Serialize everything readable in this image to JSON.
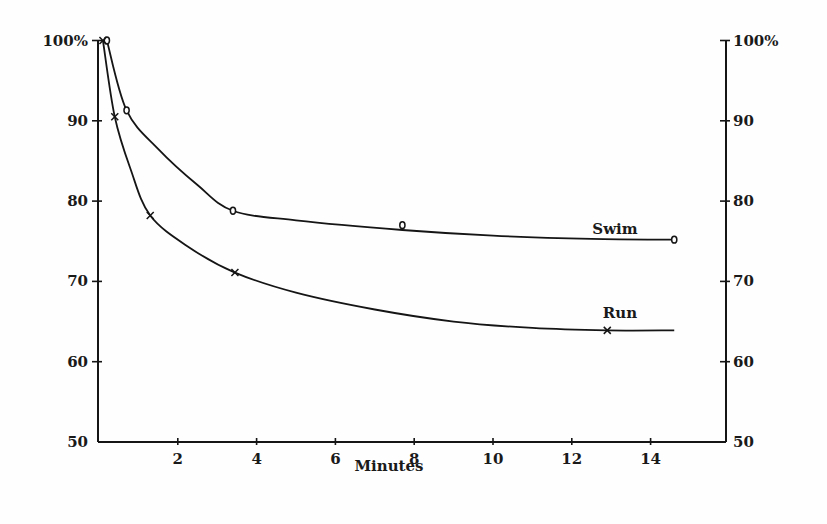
{
  "chart_data": {
    "type": "line",
    "title": "",
    "xlabel": "Minutes",
    "ylabel": "",
    "xlim": [
      0,
      15.5
    ],
    "ylim": [
      50,
      100
    ],
    "x_ticks": [
      2,
      4,
      6,
      8,
      10,
      12,
      14
    ],
    "x_tick_labels": [
      "2",
      "4",
      "6",
      "8",
      "10",
      "12",
      "14"
    ],
    "y_ticks": [
      50,
      60,
      70,
      80,
      90,
      100
    ],
    "y_tick_labels_left": [
      "50",
      "60",
      "70",
      "80",
      "90",
      "100%"
    ],
    "y_tick_labels_right": [
      "50",
      "60",
      "70",
      "80",
      "90",
      "100%"
    ],
    "grid": false,
    "legend": "inline labels at curve ends",
    "series": [
      {
        "name": "Swim",
        "marker": "o",
        "points": [
          {
            "x": 0.2,
            "y": 100
          },
          {
            "x": 0.7,
            "y": 91.3
          },
          {
            "x": 3.4,
            "y": 78.8
          },
          {
            "x": 7.7,
            "y": 77.0
          },
          {
            "x": 14.6,
            "y": 75.2
          }
        ],
        "curve": [
          {
            "x": 0.2,
            "y": 100
          },
          {
            "x": 0.7,
            "y": 91.3
          },
          {
            "x": 1.5,
            "y": 86.5
          },
          {
            "x": 2.5,
            "y": 82.0
          },
          {
            "x": 3.4,
            "y": 78.8
          },
          {
            "x": 5.0,
            "y": 77.6
          },
          {
            "x": 7.7,
            "y": 76.4
          },
          {
            "x": 10.0,
            "y": 75.7
          },
          {
            "x": 12.5,
            "y": 75.3
          },
          {
            "x": 14.6,
            "y": 75.2
          }
        ]
      },
      {
        "name": "Run",
        "marker": "x",
        "points": [
          {
            "x": 0.1,
            "y": 100
          },
          {
            "x": 0.4,
            "y": 90.5
          },
          {
            "x": 1.3,
            "y": 78.2
          },
          {
            "x": 3.45,
            "y": 71.1
          },
          {
            "x": 12.9,
            "y": 63.9
          }
        ],
        "curve": [
          {
            "x": 0.1,
            "y": 100
          },
          {
            "x": 0.4,
            "y": 90.5
          },
          {
            "x": 0.8,
            "y": 84.0
          },
          {
            "x": 1.3,
            "y": 78.2
          },
          {
            "x": 2.3,
            "y": 74.2
          },
          {
            "x": 3.45,
            "y": 71.1
          },
          {
            "x": 5.0,
            "y": 68.6
          },
          {
            "x": 7.0,
            "y": 66.5
          },
          {
            "x": 9.0,
            "y": 65.0
          },
          {
            "x": 11.0,
            "y": 64.2
          },
          {
            "x": 12.9,
            "y": 63.9
          },
          {
            "x": 14.6,
            "y": 63.9
          }
        ]
      }
    ]
  },
  "labels": {
    "x_axis_title": "Minutes",
    "swim": "Swim",
    "run": "Run"
  }
}
